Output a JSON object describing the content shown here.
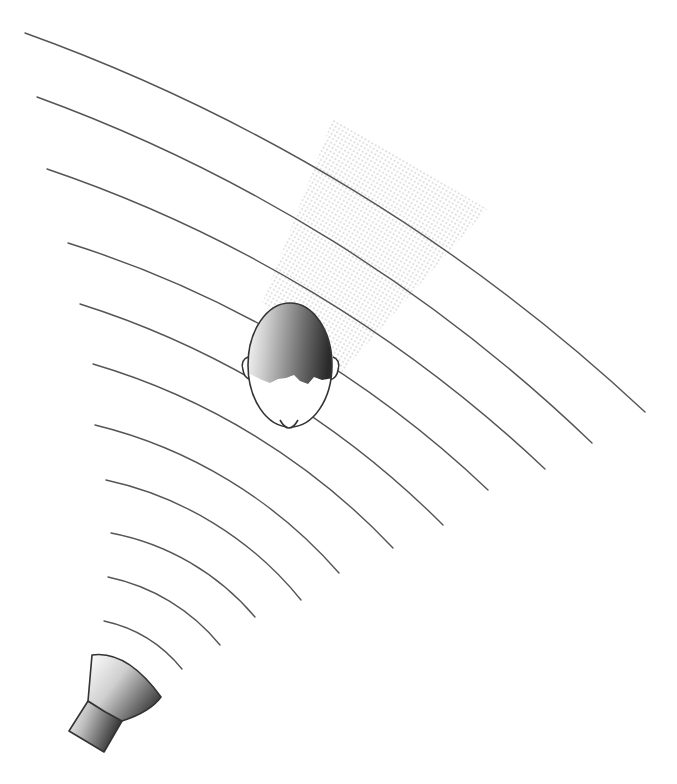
{
  "diagram": {
    "colors": {
      "background": "#ffffff",
      "wave_stroke": "#555555",
      "outline": "#333333",
      "gradient_dark": "#2e2e2e",
      "gradient_light": "#ffffff",
      "dot_pattern": "#b5b5b5"
    },
    "speaker": {
      "cone": "M92,655 Q127,650 161,697 Q150,712 122,721 Q104,712 88,701 Z",
      "neck": "M88,701 L122,721 L104,752 L69,731 Z"
    },
    "head": {
      "cx": 290,
      "cy": 365,
      "rx": 42,
      "ry": 62,
      "chin": "M280,420 Q289,436 298,420",
      "left_ear": "M248,357 Q240,360 243,370 Q244,378 251,380",
      "right_ear": "M333,357 Q341,360 338,370 Q337,378 330,380",
      "hairline_y": 382
    },
    "view_cone": {
      "points": "333,118 487,209 342,372 262,304"
    },
    "waves": [
      {
        "x1": 25,
        "y1": 33,
        "x2": 645,
        "y2": 412,
        "r": 1800
      },
      {
        "x1": 37,
        "y1": 97,
        "x2": 592,
        "y2": 443,
        "r": 1579
      },
      {
        "x1": 47,
        "y1": 169,
        "x2": 545,
        "y2": 469,
        "r": 1360
      },
      {
        "x1": 68,
        "y1": 243,
        "x2": 488,
        "y2": 490,
        "r": 1078
      },
      {
        "x1": 80,
        "y1": 304,
        "x2": 443,
        "y2": 525,
        "r": 892
      },
      {
        "x1": 93,
        "y1": 364,
        "x2": 393,
        "y2": 548,
        "r": 673
      },
      {
        "x1": 95,
        "y1": 425,
        "x2": 339,
        "y2": 573,
        "r": 472
      },
      {
        "x1": 106,
        "y1": 480,
        "x2": 301,
        "y2": 600,
        "r": 344
      },
      {
        "x1": 111,
        "y1": 533,
        "x2": 255,
        "y2": 617,
        "r": 250
      },
      {
        "x1": 108,
        "y1": 577,
        "x2": 220,
        "y2": 645,
        "r": 196
      },
      {
        "x1": 104,
        "y1": 621,
        "x2": 182,
        "y2": 669,
        "r": 138
      }
    ]
  }
}
